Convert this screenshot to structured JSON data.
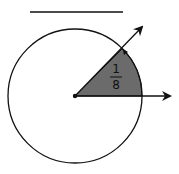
{
  "diagram": {
    "answer_blank": "",
    "fraction": {
      "numerator": "1",
      "denominator": "8"
    },
    "colors": {
      "stroke": "#111111",
      "sector_fill": "#6b6b6b",
      "background": "#ffffff"
    },
    "circle": {
      "cx": 75,
      "cy": 96,
      "r": 67
    },
    "sector_angle_degrees": 45,
    "rays": [
      "horizontal-right",
      "diagonal-45-degrees"
    ]
  }
}
